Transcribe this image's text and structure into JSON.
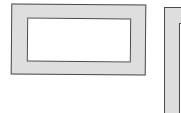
{
  "figure": {
    "colors": {
      "frame_fill": "#dedede",
      "frame_border": "#4a4a4a",
      "inner_fill": "#ffffff",
      "background": "#ffffff"
    },
    "shapes": [
      {
        "name": "left-frame",
        "outer": [
          11,
          4,
          146,
          75
        ],
        "inner": [
          27,
          18,
          131,
          62
        ]
      },
      {
        "name": "right-frame",
        "outer": [
          164,
          7,
          181,
          113
        ],
        "inner": [
          178,
          22,
          181,
          113
        ],
        "clipped": true
      }
    ]
  }
}
